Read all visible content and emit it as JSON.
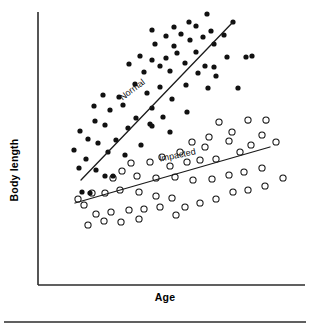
{
  "figure": {
    "width": 310,
    "height": 335,
    "background": "#ffffff",
    "ink_color": "#111111",
    "axis_color": "#2b2b2b"
  },
  "axes": {
    "x_title": "Age",
    "y_title": "Body length",
    "x_axis_name": "x-axis-line",
    "y_axis_name": "y-axis-line",
    "grid": false,
    "tick_labels_x": [],
    "tick_labels_y": [],
    "plot_left": 38,
    "plot_right": 305,
    "plot_top": 12,
    "plot_bottom": 285
  },
  "footer": {
    "rule_visible": true
  },
  "chart_data": {
    "type": "scatter",
    "title": "",
    "xlabel": "Age",
    "ylabel": "Body length",
    "xlim": [
      0,
      100
    ],
    "ylim": [
      0,
      100
    ],
    "grid": false,
    "legend_position": "inline-along-trend-lines",
    "annotations": [
      {
        "text": "Normal",
        "x_px": 134,
        "y_px": 92,
        "rotation_deg": -37,
        "series": "Normal"
      },
      {
        "text": "Impacted",
        "x_px": 178,
        "y_px": 158,
        "rotation_deg": -12,
        "series": "Impacted"
      }
    ],
    "series": [
      {
        "name": "Normal",
        "marker": "filled-circle",
        "marker_color": "#111111",
        "marker_radius_px": 2.6,
        "trend_line": {
          "x1_px": 81,
          "y1_px": 180,
          "x2_px": 233,
          "y2_px": 22,
          "color": "#1a1a1a"
        },
        "points_px": [
          [
            207,
            14
          ],
          [
            189,
            22
          ],
          [
            233,
            22
          ],
          [
            174,
            27
          ],
          [
            196,
            26
          ],
          [
            152,
            30
          ],
          [
            211,
            31
          ],
          [
            181,
            34
          ],
          [
            224,
            35
          ],
          [
            166,
            36
          ],
          [
            203,
            37
          ],
          [
            190,
            40
          ],
          [
            214,
            44
          ],
          [
            155,
            44
          ],
          [
            174,
            46
          ],
          [
            246,
            57
          ],
          [
            227,
            57
          ],
          [
            177,
            53
          ],
          [
            196,
            52
          ],
          [
            140,
            56
          ],
          [
            166,
            58
          ],
          [
            152,
            60
          ],
          [
            185,
            63
          ],
          [
            205,
            66
          ],
          [
            129,
            64
          ],
          [
            214,
            67
          ],
          [
            160,
            66
          ],
          [
            170,
            71
          ],
          [
            144,
            72
          ],
          [
            198,
            73
          ],
          [
            103,
            95
          ],
          [
            135,
            84
          ],
          [
            186,
            85
          ],
          [
            160,
            87
          ],
          [
            119,
            97
          ],
          [
            208,
            88
          ],
          [
            147,
            93
          ],
          [
            123,
            105
          ],
          [
            172,
            99
          ],
          [
            94,
            106
          ],
          [
            110,
            110
          ],
          [
            152,
            108
          ],
          [
            187,
            112
          ],
          [
            95,
            121
          ],
          [
            136,
            118
          ],
          [
            163,
            117
          ],
          [
            80,
            131
          ],
          [
            105,
            125
          ],
          [
            128,
            128
          ],
          [
            150,
            124
          ],
          [
            152,
            126
          ],
          [
            170,
            132
          ],
          [
            88,
            139
          ],
          [
            116,
            140
          ],
          [
            141,
            145
          ],
          [
            74,
            150
          ],
          [
            98,
            143
          ],
          [
            108,
            152
          ],
          [
            125,
            155
          ],
          [
            86,
            159
          ],
          [
            252,
            56
          ],
          [
            238,
            88
          ],
          [
            216,
            76
          ],
          [
            96,
            170
          ],
          [
            105,
            176
          ],
          [
            113,
            176
          ],
          [
            79,
            168
          ],
          [
            82,
            192
          ],
          [
            90,
            193
          ]
        ]
      },
      {
        "name": "Impacted",
        "marker": "open-circle",
        "marker_color": "#ffffff",
        "marker_edge_color": "#111111",
        "marker_radius_px": 3.1,
        "trend_line": {
          "x1_px": 75,
          "y1_px": 203,
          "x2_px": 270,
          "y2_px": 147,
          "color": "#1a1a1a"
        },
        "points_px": [
          [
            248,
            120
          ],
          [
            266,
            120
          ],
          [
            219,
            122
          ],
          [
            232,
            132
          ],
          [
            262,
            135
          ],
          [
            229,
            141
          ],
          [
            251,
            145
          ],
          [
            209,
            137
          ],
          [
            205,
            147
          ],
          [
            192,
            142
          ],
          [
            240,
            152
          ],
          [
            276,
            142
          ],
          [
            180,
            152
          ],
          [
            216,
            159
          ],
          [
            162,
            157
          ],
          [
            200,
            160
          ],
          [
            187,
            162
          ],
          [
            170,
            166
          ],
          [
            150,
            162
          ],
          [
            131,
            163
          ],
          [
            122,
            171
          ],
          [
            113,
            178
          ],
          [
            137,
            176
          ],
          [
            156,
            178
          ],
          [
            175,
            177
          ],
          [
            193,
            180
          ],
          [
            212,
            179
          ],
          [
            229,
            175
          ],
          [
            244,
            172
          ],
          [
            262,
            168
          ],
          [
            283,
            178
          ],
          [
            92,
            193
          ],
          [
            105,
            193
          ],
          [
            120,
            190
          ],
          [
            139,
            192
          ],
          [
            156,
            196
          ],
          [
            172,
            198
          ],
          [
            160,
            207
          ],
          [
            144,
            209
          ],
          [
            129,
            210
          ],
          [
            111,
            212
          ],
          [
            96,
            214
          ],
          [
            185,
            207
          ],
          [
            200,
            203
          ],
          [
            216,
            199
          ],
          [
            233,
            192
          ],
          [
            248,
            190
          ],
          [
            265,
            186
          ],
          [
            88,
            225
          ],
          [
            104,
            221
          ],
          [
            121,
            222
          ],
          [
            139,
            219
          ],
          [
            176,
            215
          ],
          [
            84,
            205
          ],
          [
            78,
            199
          ]
        ]
      }
    ]
  }
}
